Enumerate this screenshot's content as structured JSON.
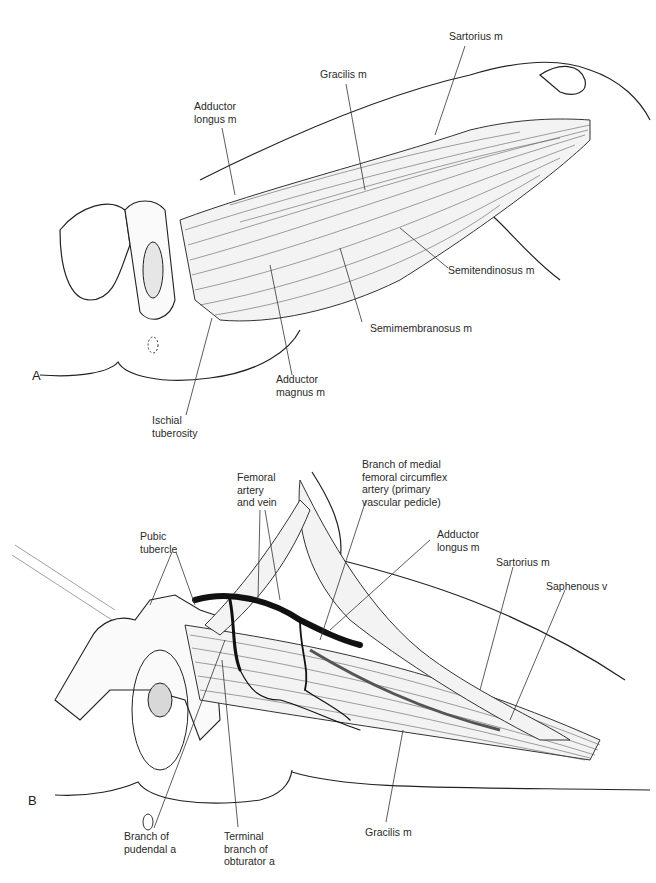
{
  "figure": {
    "panels": [
      {
        "id": "A",
        "label": "A",
        "annotations": [
          {
            "key": "sartorius",
            "text": "Sartorius m"
          },
          {
            "key": "gracilis",
            "text": "Gracilis m"
          },
          {
            "key": "adductor_longus",
            "text": "Adductor\nlongus m"
          },
          {
            "key": "semitendinosus",
            "text": "Semitendinosus m"
          },
          {
            "key": "semimembranosus",
            "text": "Semimembranosus m"
          },
          {
            "key": "adductor_magnus",
            "text": "Adductor\nmagnus m"
          },
          {
            "key": "ischial_tuberosity",
            "text": "Ischial\ntuberosity"
          }
        ]
      },
      {
        "id": "B",
        "label": "B",
        "annotations": [
          {
            "key": "femoral_artery_vein",
            "text": "Femoral\nartery\nand vein"
          },
          {
            "key": "medial_femoral_circumflex",
            "text": "Branch of medial\nfemoral circumflex\nartery (primary\nvascular pedicle)"
          },
          {
            "key": "pubic_tubercle",
            "text": "Pubic\ntubercle"
          },
          {
            "key": "adductor_longus",
            "text": "Adductor\nlongus m"
          },
          {
            "key": "sartorius",
            "text": "Sartorius m"
          },
          {
            "key": "saphenous",
            "text": "Saphenous v"
          },
          {
            "key": "pudendal",
            "text": "Branch of\npudendal a"
          },
          {
            "key": "obturator",
            "text": "Terminal\nbranch of\nobturator a"
          },
          {
            "key": "gracilis",
            "text": "Gracilis m"
          }
        ]
      }
    ]
  }
}
